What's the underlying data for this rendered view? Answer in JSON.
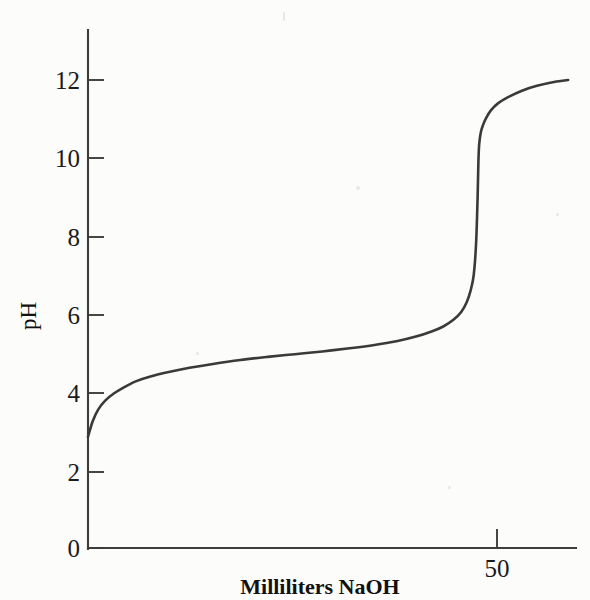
{
  "figure": {
    "background_color": "#fcfcfa",
    "ink_color": "#3a3a3a",
    "axis_color": "#3d3d3d"
  },
  "axes": {
    "y_title": "pH",
    "x_title": "Milliliters NaOH",
    "y_ticks": [
      "0",
      "2",
      "4",
      "6",
      "8",
      "10",
      "12"
    ],
    "x_ticks": [
      "50"
    ]
  },
  "chart_data": {
    "type": "line",
    "title": "",
    "subtitle": "",
    "xlabel": "Milliliters NaOH",
    "ylabel": "pH",
    "xlim": [
      0,
      62.5
    ],
    "ylim": [
      0,
      14
    ],
    "grid": false,
    "legend": null,
    "annotations": [],
    "y_tick_values": [
      0,
      2,
      4,
      6,
      8,
      10,
      12
    ],
    "y_tick_labels": [
      "0",
      "2",
      "4",
      "6",
      "8",
      "10",
      "12"
    ],
    "x_tick_values": [
      50
    ],
    "x_tick_labels": [
      "50"
    ],
    "series": [
      {
        "name": "Titration curve (weak acid titrated with NaOH)",
        "color": "#3a3a3a",
        "x": [
          0.0,
          0.6,
          1.3,
          2.2,
          3.3,
          4.6,
          6.2,
          8.0,
          10.5,
          13.0,
          16.0,
          19.5,
          23.0,
          26.5,
          30.0,
          33.5,
          36.5,
          39.5,
          42.0,
          44.0,
          45.5,
          46.8,
          47.8,
          48.5,
          49.0,
          49.4,
          49.7,
          49.9,
          50.0,
          50.1,
          50.3,
          50.6,
          51.0,
          51.6,
          52.5,
          53.8,
          55.5,
          57.5,
          60.0,
          61.5
        ],
        "y": [
          2.85,
          3.25,
          3.55,
          3.78,
          3.96,
          4.12,
          4.28,
          4.4,
          4.52,
          4.62,
          4.72,
          4.82,
          4.9,
          4.97,
          5.04,
          5.12,
          5.2,
          5.3,
          5.42,
          5.55,
          5.68,
          5.85,
          6.05,
          6.3,
          6.6,
          7.0,
          7.8,
          9.0,
          9.9,
          10.35,
          10.65,
          10.85,
          11.03,
          11.22,
          11.4,
          11.56,
          11.72,
          11.85,
          11.96,
          12.0
        ]
      }
    ],
    "equivalence_point": {
      "x": 50,
      "y": 9.0
    }
  }
}
